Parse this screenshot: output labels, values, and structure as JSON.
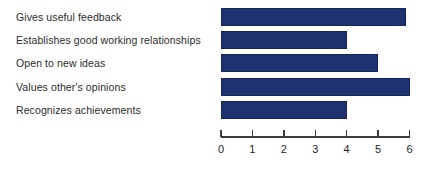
{
  "chart_data": {
    "type": "bar",
    "orientation": "horizontal",
    "title": "",
    "subtitle": "",
    "xlabel": "",
    "ylabel": "",
    "categories": [
      "Gives useful feedback",
      "Establishes good working relationships",
      "Open to new ideas",
      "Values other's opinions",
      "Recognizes achievements"
    ],
    "values": [
      5.9,
      4.0,
      5.0,
      6.0,
      4.0
    ],
    "xlim": [
      0,
      6
    ],
    "xticks": [
      0,
      1,
      2,
      3,
      4,
      5,
      6
    ],
    "xtick_labels": [
      "0",
      "1",
      "2",
      "3",
      "4",
      "5",
      "6"
    ],
    "grid": false,
    "legend": false,
    "bar_color": "#1e3270",
    "bar_border_color": "#16265a",
    "axis_color": "#3a3a3a",
    "label_color": "#2b2b2b",
    "background_color": "#ffffff"
  }
}
